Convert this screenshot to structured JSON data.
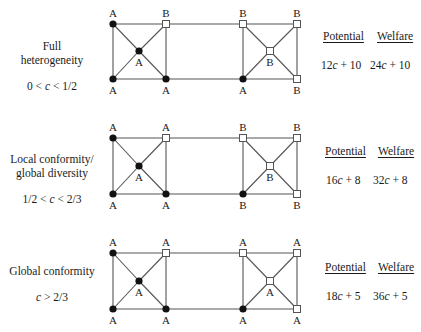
{
  "column_headers": {
    "potential": "Potential",
    "welfare": "Welfare"
  },
  "colors": {
    "edge": "#555555",
    "filled_node": "#111111",
    "open_node_fill": "#ffffff",
    "open_node_stroke": "#555555",
    "text": "#1a1a1a"
  },
  "node_legend": {
    "filled_circle": "action A (filled)",
    "open_square": "action B (open)"
  },
  "rows": [
    {
      "title_lines": [
        "Full",
        "heterogeneity"
      ],
      "condition": "0 < c < 1/2",
      "potential": "12c + 10",
      "welfare": "24c + 10",
      "y_top": 24,
      "y_mid": 51,
      "y_bot": 79,
      "left_square": {
        "tl": {
          "label": "A",
          "shape": "circle"
        },
        "tr": {
          "label": "B",
          "shape": "square"
        },
        "c": {
          "label": "A",
          "shape": "circle"
        },
        "bl": {
          "label": "A",
          "shape": "circle"
        },
        "br": {
          "label": "A",
          "shape": "circle"
        }
      },
      "right_square": {
        "tl": {
          "label": "B",
          "shape": "square"
        },
        "tr": {
          "label": "B",
          "shape": "square"
        },
        "c": {
          "label": "B",
          "shape": "square"
        },
        "bl": {
          "label": "A",
          "shape": "circle"
        },
        "br": {
          "label": "B",
          "shape": "square"
        }
      }
    },
    {
      "title_lines": [
        "Local conformity/",
        "global diversity"
      ],
      "condition": "1/2 < c < 2/3",
      "potential": "16c + 8",
      "welfare": "32c + 8",
      "y_top": 138,
      "y_mid": 166,
      "y_bot": 194,
      "left_square": {
        "tl": {
          "label": "A",
          "shape": "circle"
        },
        "tr": {
          "label": "A",
          "shape": "square"
        },
        "c": {
          "label": "A",
          "shape": "circle"
        },
        "bl": {
          "label": "A",
          "shape": "circle"
        },
        "br": {
          "label": "A",
          "shape": "circle"
        }
      },
      "right_square": {
        "tl": {
          "label": "B",
          "shape": "square"
        },
        "tr": {
          "label": "B",
          "shape": "square"
        },
        "c": {
          "label": "B",
          "shape": "square"
        },
        "bl": {
          "label": "B",
          "shape": "circle"
        },
        "br": {
          "label": "B",
          "shape": "square"
        }
      }
    },
    {
      "title_lines": [
        "Global conformity"
      ],
      "condition": "c > 2/3",
      "potential": "18c + 5",
      "welfare": "36c + 5",
      "y_top": 253,
      "y_mid": 281,
      "y_bot": 309,
      "left_square": {
        "tl": {
          "label": "A",
          "shape": "circle"
        },
        "tr": {
          "label": "A",
          "shape": "square"
        },
        "c": {
          "label": "A",
          "shape": "circle"
        },
        "bl": {
          "label": "A",
          "shape": "circle"
        },
        "br": {
          "label": "A",
          "shape": "circle"
        }
      },
      "right_square": {
        "tl": {
          "label": "A",
          "shape": "square"
        },
        "tr": {
          "label": "A",
          "shape": "square"
        },
        "c": {
          "label": "A",
          "shape": "square"
        },
        "bl": {
          "label": "A",
          "shape": "circle"
        },
        "br": {
          "label": "A",
          "shape": "square"
        }
      }
    }
  ],
  "geometry": {
    "left_x1": 113,
    "left_x2": 166,
    "left_cx": 139,
    "right_x1": 243,
    "right_x2": 297,
    "right_cx": 270
  }
}
